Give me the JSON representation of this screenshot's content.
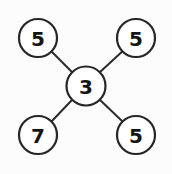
{
  "diagram": {
    "type": "node-link-diagram",
    "canvas": {
      "width": 172,
      "height": 174,
      "background": "#fcfcfc"
    },
    "style": {
      "node_fill": "#ffffff",
      "node_stroke": "#262626",
      "node_stroke_width": 2.2,
      "edge_stroke": "#2b2b2b",
      "edge_stroke_width": 2,
      "label_color": "#141414"
    },
    "nodes": [
      {
        "id": "center",
        "label": "3",
        "cx": 86,
        "cy": 86,
        "r": 19.5,
        "role": "hub"
      },
      {
        "id": "top-left",
        "label": "5",
        "cx": 38,
        "cy": 38,
        "r": 19,
        "role": "leaf"
      },
      {
        "id": "top-right",
        "label": "5",
        "cx": 136,
        "cy": 38,
        "r": 19,
        "role": "leaf"
      },
      {
        "id": "bottom-left",
        "label": "7",
        "cx": 38,
        "cy": 135,
        "r": 19,
        "role": "leaf"
      },
      {
        "id": "bottom-right",
        "label": "5",
        "cx": 136,
        "cy": 135,
        "r": 19,
        "role": "leaf"
      }
    ],
    "edges": [
      {
        "from": "center",
        "to": "top-left",
        "x1": 72.2,
        "y1": 72.2,
        "x2": 51.8,
        "y2": 51.8
      },
      {
        "from": "center",
        "to": "top-right",
        "x1": 99.8,
        "y1": 72.2,
        "x2": 122.25,
        "y2": 51.6
      },
      {
        "from": "center",
        "to": "bottom-left",
        "x1": 72.2,
        "y1": 99.8,
        "x2": 51.7,
        "y2": 121.2
      },
      {
        "from": "center",
        "to": "bottom-right",
        "x1": 99.8,
        "y1": 99.8,
        "x2": 122.3,
        "y2": 121.2
      }
    ]
  }
}
